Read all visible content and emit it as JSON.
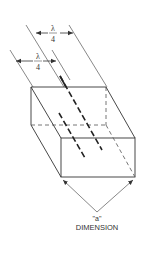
{
  "diagram": {
    "labels": {
      "upper_dim_numerator": "λ",
      "upper_dim_denominator": "4",
      "lower_dim_numerator": "λ",
      "lower_dim_denominator": "4",
      "a_label": "\"a\"",
      "dimension_label": "DIMENSION"
    },
    "colors": {
      "line": "#333333",
      "thin_line": "#555555",
      "background": "#ffffff"
    }
  }
}
